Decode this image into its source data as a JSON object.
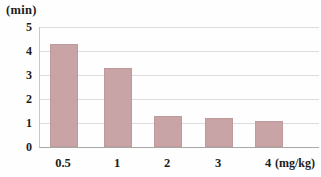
{
  "chart_data": {
    "type": "bar",
    "title": "",
    "ylabel": "(min)",
    "x_unit": "(mg/kg)",
    "categories": [
      "0.5",
      "1",
      "2",
      "3",
      "4"
    ],
    "values": [
      4.3,
      3.3,
      1.3,
      1.2,
      1.1
    ],
    "ylim": [
      0,
      5
    ],
    "yticks": [
      0,
      1,
      2,
      3,
      4,
      5
    ],
    "grid": true,
    "legend_position": "none",
    "bar_color": "#c9a4a6",
    "gridline_color": "#dcdcdc",
    "axis_color": "#a8a8a8",
    "text_color": "#1c1c1c",
    "background_color": "#fefefe"
  }
}
